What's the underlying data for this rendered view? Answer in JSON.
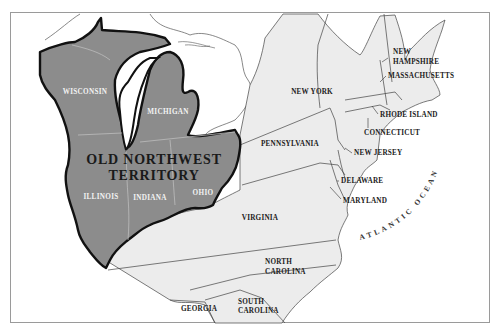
{
  "map": {
    "title_line1": "OLD NORTHWEST",
    "title_line2": "TERRITORY",
    "colors": {
      "territory_fill": "#8c8c8c",
      "states_fill": "#ececec",
      "water": "#ffffff",
      "border": "#111111",
      "frame": "#999999"
    },
    "territory_states": {
      "wisconsin": "WISCONSIN",
      "michigan": "MICHIGAN",
      "illinois": "ILLINOIS",
      "indiana": "INDIANA",
      "ohio": "OHIO"
    },
    "states": {
      "new_york": "NEW YORK",
      "new_hampshire_1": "NEW",
      "new_hampshire_2": "HAMPSHIRE",
      "massachusetts": "MASSACHUSETTS",
      "rhode_island": "RHODE ISLAND",
      "connecticut": "CONNECTICUT",
      "pennsylvania": "PENNSYLVANIA",
      "new_jersey": "NEW JERSEY",
      "delaware": "DELAWARE",
      "maryland": "MARYLAND",
      "virginia": "VIRGINIA",
      "north_carolina_1": "NORTH",
      "north_carolina_2": "CAROLINA",
      "south_carolina_1": "SOUTH",
      "south_carolina_2": "CAROLINA",
      "georgia": "GEORGIA"
    },
    "ocean": "ATLANTIC OCEAN"
  }
}
